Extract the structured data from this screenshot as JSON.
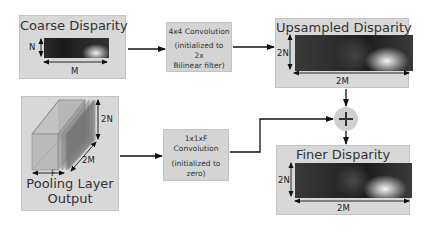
{
  "diagram": {
    "coarse_disparity": {
      "title": "Coarse Disparity",
      "height_label": "N",
      "width_label": "M"
    },
    "upsample_conv": {
      "line1": "4x4 Convolution",
      "line2": "(initialized to",
      "line3": "2x",
      "line4": "Bilinear filter)"
    },
    "upsampled_disparity": {
      "title": "Upsampled Disparity",
      "height_label": "2N",
      "width_label": "2M"
    },
    "pooling_layer": {
      "title_line1": "Pooling Layer",
      "title_line2": "Output",
      "depth_label": "F",
      "width_label": "2M",
      "height_label": "2N"
    },
    "refine_conv": {
      "line1": "1x1xF",
      "line2": "Convolution",
      "line3": "(initialized to",
      "line4": "zero)"
    },
    "sum_node": {
      "symbol": "+"
    },
    "finer_disparity": {
      "title": "Finer Disparity",
      "height_label": "2N",
      "width_label": "2M"
    },
    "colors": {
      "panel": "#d8d8d8",
      "arrow": "#111111",
      "node": "#cfcfcf"
    }
  }
}
